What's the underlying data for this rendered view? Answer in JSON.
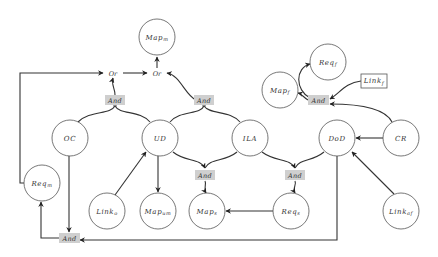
{
  "diagram": {
    "type": "and-or goal graph",
    "nodes": [
      {
        "id": "map_m",
        "label": "Map",
        "sub": "m",
        "shape": "circle",
        "x": 157,
        "y": 37
      },
      {
        "id": "oc",
        "label": "OC",
        "sub": "",
        "shape": "circle",
        "x": 70,
        "y": 138
      },
      {
        "id": "ud",
        "label": "UD",
        "sub": "",
        "shape": "circle",
        "x": 160,
        "y": 138
      },
      {
        "id": "ila",
        "label": "ILA",
        "sub": "",
        "shape": "circle",
        "x": 250,
        "y": 138
      },
      {
        "id": "dod",
        "label": "DoD",
        "sub": "",
        "shape": "circle",
        "x": 337,
        "y": 138
      },
      {
        "id": "cr",
        "label": "CR",
        "sub": "",
        "shape": "circle",
        "x": 401,
        "y": 138
      },
      {
        "id": "req_m",
        "label": "Req",
        "sub": "m",
        "shape": "circle",
        "x": 42,
        "y": 183
      },
      {
        "id": "link_o",
        "label": "Link",
        "sub": "o",
        "shape": "circle",
        "x": 107,
        "y": 211
      },
      {
        "id": "map_um",
        "label": "Map",
        "sub": "um",
        "shape": "circle",
        "x": 158,
        "y": 211
      },
      {
        "id": "map_s",
        "label": "Map",
        "sub": "s",
        "shape": "circle",
        "x": 207,
        "y": 211
      },
      {
        "id": "req_s",
        "label": "Req",
        "sub": "s",
        "shape": "circle",
        "x": 291,
        "y": 211
      },
      {
        "id": "link_af",
        "label": "Link",
        "sub": "af",
        "shape": "circle",
        "x": 401,
        "y": 211
      },
      {
        "id": "map_f",
        "label": "Map",
        "sub": "f",
        "shape": "circle",
        "x": 280,
        "y": 90
      },
      {
        "id": "req_f",
        "label": "Req",
        "sub": "f",
        "shape": "circle",
        "x": 328,
        "y": 62
      },
      {
        "id": "link_f",
        "label": "Link",
        "sub": "f",
        "shape": "box",
        "x": 373,
        "y": 81
      }
    ],
    "gates": [
      {
        "id": "or_left",
        "label": "Or",
        "x": 113,
        "y": 73
      },
      {
        "id": "or_right",
        "label": "Or",
        "x": 157,
        "y": 73
      },
      {
        "id": "and_oc_ud",
        "label": "And",
        "x": 115,
        "y": 100
      },
      {
        "id": "and_ud_ila_top",
        "label": "And",
        "x": 204,
        "y": 100
      },
      {
        "id": "and_ud_ila_bottom",
        "label": "And",
        "x": 205,
        "y": 175
      },
      {
        "id": "and_ila_dod",
        "label": "And",
        "x": 295,
        "y": 175
      },
      {
        "id": "and_f",
        "label": "And",
        "x": 318,
        "y": 100
      },
      {
        "id": "and_bottom",
        "label": "And",
        "x": 69,
        "y": 238
      }
    ]
  }
}
